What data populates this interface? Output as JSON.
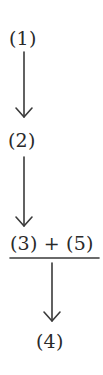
{
  "diagram": {
    "type": "flow",
    "nodes": [
      {
        "id": "1",
        "label": "(1)"
      },
      {
        "id": "2",
        "label": "(2)"
      },
      {
        "id": "3+5",
        "label": "(3) + (5)"
      },
      {
        "id": "4",
        "label": "(4)"
      }
    ],
    "edges": [
      {
        "from": "1",
        "to": "2"
      },
      {
        "from": "2",
        "to": "3+5"
      },
      {
        "from": "3+5",
        "to": "4"
      }
    ],
    "combination_bar_under": "(3) + (5)",
    "colors": {
      "text": "#2a2a2a",
      "stroke": "#3a3a3a",
      "background": "#ffffff"
    }
  }
}
